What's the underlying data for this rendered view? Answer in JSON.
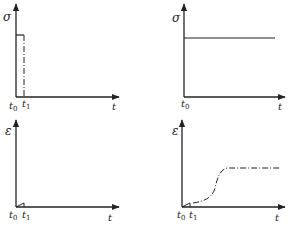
{
  "figure": {
    "colors": {
      "ink": "#222222",
      "background": "#ffffff"
    },
    "panels": [
      {
        "id": "top-left",
        "y_label": "σ",
        "x_label": "t",
        "ticks": [
          {
            "base": "t",
            "sub": "0"
          },
          {
            "base": "t",
            "sub": "1"
          }
        ],
        "curve": "stress held from t0 to t1, then removed (dash-dot drop at t1)"
      },
      {
        "id": "top-right",
        "y_label": "σ",
        "x_label": "t",
        "ticks": [
          {
            "base": "t",
            "sub": "0"
          }
        ],
        "curve": "constant stress applied from t0"
      },
      {
        "id": "bottom-left",
        "y_label": "ε",
        "x_label": "t",
        "ticks": [
          {
            "base": "t",
            "sub": "0"
          },
          {
            "base": "t",
            "sub": "1"
          }
        ],
        "curve": "small strain ramp between t0 and t1"
      },
      {
        "id": "bottom-right",
        "y_label": "ε",
        "x_label": "t",
        "ticks": [
          {
            "base": "t",
            "sub": "0"
          },
          {
            "base": "t",
            "sub": "1"
          }
        ],
        "curve": "small ramp then dash-dot S-shaped rise to a plateau"
      }
    ]
  }
}
